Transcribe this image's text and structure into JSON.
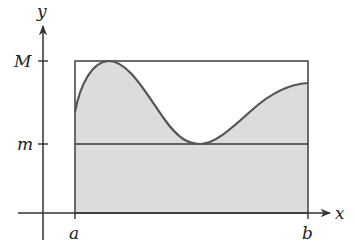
{
  "diagram": {
    "title": "",
    "axes": {
      "x_label": "x",
      "y_label": "y"
    },
    "y_ticks": [
      {
        "label": "M",
        "y": 61
      },
      {
        "label": "m",
        "y": 144
      }
    ],
    "x_ticks": [
      {
        "label": "a",
        "x": 75
      },
      {
        "label": "b",
        "x": 308
      }
    ],
    "colors": {
      "fill": "#dcdcdc",
      "stroke": "#4a4a4a",
      "curve": "#555555"
    }
  }
}
